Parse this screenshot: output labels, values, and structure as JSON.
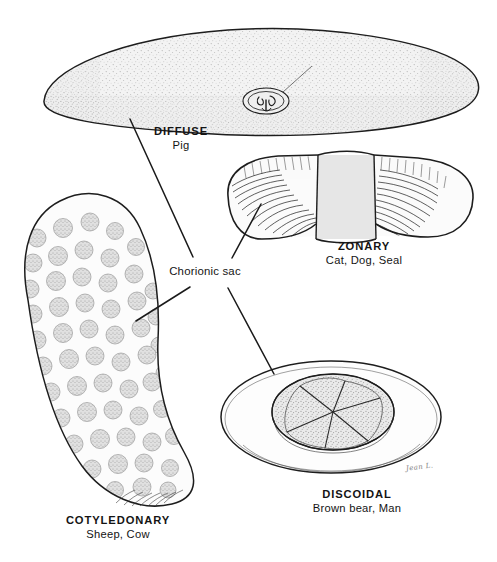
{
  "figure": {
    "center_label": "Chorionic sac",
    "signature": "Jean L.",
    "colors": {
      "ink": "#1a1a1a",
      "background": "#ffffff",
      "sac_fill": "#f0f0f0",
      "stipple": "#9a9a9a",
      "band_fill": "#e2e2e2",
      "cotyledon_fill": "#dedede"
    }
  },
  "specimens": [
    {
      "id": "diffuse",
      "type": "DIFFUSE",
      "species": "Pig",
      "shape": "elongated-flattened-sac"
    },
    {
      "id": "zonary",
      "type": "ZONARY",
      "species": "Cat, Dog, Seal",
      "shape": "curved-band-with-central-belt"
    },
    {
      "id": "cotyledonary",
      "type": "COTYLEDONARY",
      "species": "Sheep, Cow",
      "shape": "bean-sac-with-cotyledons"
    },
    {
      "id": "discoidal",
      "type": "DISCOIDAL",
      "species": "Brown bear, Man",
      "shape": "oval-sac-with-lobed-disc"
    }
  ],
  "leader_lines": [
    {
      "name": "leader-to-diffuse",
      "from": [
        193,
        257
      ],
      "to": [
        130,
        119
      ]
    },
    {
      "name": "leader-to-zonary",
      "from": [
        232,
        258
      ],
      "to": [
        261,
        204
      ]
    },
    {
      "name": "leader-to-cotyledonary",
      "from": [
        190,
        287
      ],
      "to": [
        136,
        321
      ]
    },
    {
      "name": "leader-to-discoidal",
      "from": [
        228,
        288
      ],
      "to": [
        274,
        374
      ]
    }
  ]
}
